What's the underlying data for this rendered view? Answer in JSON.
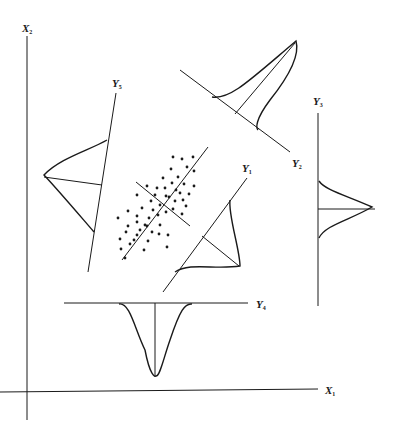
{
  "diagram": {
    "title": "",
    "axes": {
      "x1": {
        "label": "X",
        "sub": "1"
      },
      "x2": {
        "label": "X",
        "sub": "2"
      }
    },
    "projections": [
      {
        "id": "y1",
        "label": "Y",
        "sub": "1",
        "shape": "skewed"
      },
      {
        "id": "y2",
        "label": "Y",
        "sub": "2",
        "shape": "highly-skewed"
      },
      {
        "id": "y3",
        "label": "Y",
        "sub": "3",
        "shape": "normal"
      },
      {
        "id": "y4",
        "label": "Y",
        "sub": "4",
        "shape": "normal-peaked"
      },
      {
        "id": "y5",
        "label": "Y",
        "sub": "5",
        "shape": "normal-wide"
      }
    ],
    "scatter": {
      "description": "elongated bivariate point cloud with two orthogonal principal axes",
      "point_count": 55
    },
    "colors": {
      "ink": "#1a1a1a",
      "background": "#ffffff"
    }
  }
}
